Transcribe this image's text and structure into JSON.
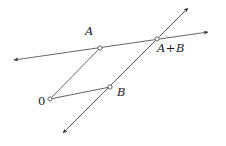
{
  "figure": {
    "background_color": "#ffffff",
    "stroke_color": "#555555",
    "label_color": "#1a1a1a",
    "width": 226,
    "height": 146
  },
  "labels": {
    "origin": "0",
    "point_a": "A",
    "point_b": "B",
    "point_sum_left": "A",
    "point_sum_op": "+",
    "point_sum_right": "B",
    "point_sum_full": "A+B"
  },
  "chart_data": {
    "type": "diagram",
    "points": [
      {
        "name": "0",
        "label": "0",
        "x": 50,
        "y": 99,
        "marker": "open-circle",
        "label_x": 38,
        "label_y": 97
      },
      {
        "name": "A",
        "label": "A",
        "x": 100,
        "y": 48,
        "marker": "open-circle",
        "label_x": 84,
        "label_y": 28
      },
      {
        "name": "B",
        "label": "B",
        "x": 110,
        "y": 87,
        "marker": "open-circle",
        "label_x": 115,
        "label_y": 88
      },
      {
        "name": "A+B",
        "label": "A+B",
        "x": 157,
        "y": 39,
        "marker": "open-circle",
        "label_x": 157,
        "label_y": 43
      }
    ],
    "lines": [
      {
        "name": "line-through-a-and-sum",
        "from": [
          14,
          60
        ],
        "to": [
          208,
          32
        ],
        "arrow_start": true,
        "arrow_end": true,
        "passes_through": [
          "A",
          "A+B"
        ]
      },
      {
        "name": "line-through-b-and-sum",
        "from": [
          63,
          133
        ],
        "to": [
          188,
          8
        ],
        "arrow_start": true,
        "arrow_end": true,
        "passes_through": [
          "B",
          "A+B"
        ]
      }
    ],
    "segments": [
      {
        "name": "segment-origin-to-a",
        "from": [
          50,
          99
        ],
        "to": [
          100,
          48
        ]
      },
      {
        "name": "segment-origin-to-b",
        "from": [
          50,
          99
        ],
        "to": [
          110,
          87
        ]
      }
    ],
    "xlabel": "",
    "ylabel": "",
    "grid": false,
    "legend": null
  }
}
